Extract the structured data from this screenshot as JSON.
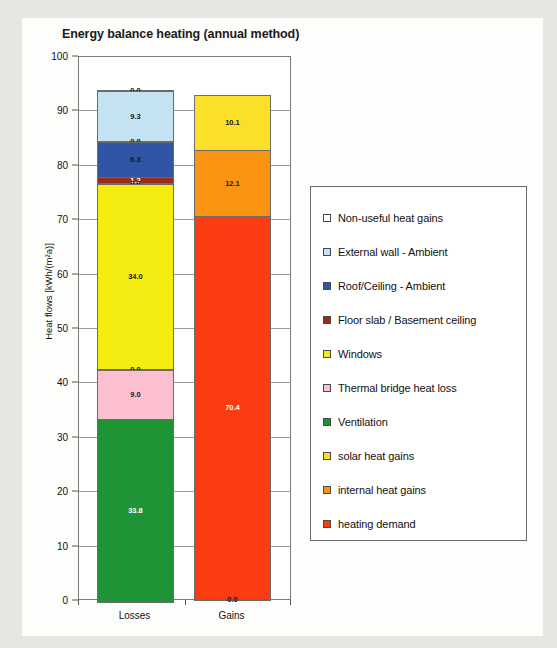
{
  "chart_data": {
    "type": "bar",
    "stacked": true,
    "title": "Energy balance heating (annual method)",
    "xlabel": "",
    "ylabel": "Heat flows [kWh/(m²a)]",
    "ylim": [
      0,
      100
    ],
    "ytick_labels": [
      "100",
      "90",
      "80",
      "70",
      "60",
      "50",
      "40",
      "30",
      "20",
      "10",
      "0"
    ],
    "ytick_values": [
      100,
      90,
      80,
      70,
      60,
      50,
      40,
      30,
      20,
      10,
      0
    ],
    "grid": true,
    "legend_position": "right",
    "categories": [
      "Losses",
      "Gains"
    ],
    "series": [
      {
        "name": "Non-useful heat gains",
        "color": "#ffffff",
        "values": [
          0.0,
          null
        ]
      },
      {
        "name": "External wall - Ambient",
        "color": "#c5e2f2",
        "values": [
          9.3,
          null
        ]
      },
      {
        "name": "Roof/Ceiling - Ambient",
        "color": "#2f55a4",
        "values": [
          6.3,
          null
        ]
      },
      {
        "name": "Floor slab / Basement ceiling",
        "color": "#9e2a15",
        "values": [
          1.2,
          null
        ]
      },
      {
        "name": "Windows",
        "color": "#f5ec12",
        "values": [
          34.0,
          null
        ]
      },
      {
        "name": "Thermal bridge heat loss",
        "color": "#fbbfcf",
        "values": [
          9.0,
          null
        ]
      },
      {
        "name": "Ventilation",
        "color": "#1f9437",
        "values": [
          33.8,
          null
        ]
      },
      {
        "name": "solar heat gains",
        "color": "#fbe02a",
        "values": [
          null,
          10.1
        ]
      },
      {
        "name": "internal heat gains",
        "color": "#fb9412",
        "values": [
          null,
          12.1
        ]
      },
      {
        "name": "heating demand",
        "color": "#fb3b12",
        "values": [
          null,
          70.4
        ]
      }
    ],
    "losses_stack": [
      {
        "label": "0.0",
        "value": 0.0,
        "series": "Non-useful heat gains",
        "color": "#ffffff",
        "text": "dark"
      },
      {
        "label": "9.3",
        "value": 9.3,
        "series": "External wall - Ambient",
        "color": "#c5e2f2",
        "text": "dark"
      },
      {
        "label": "0.0",
        "value": 0.0,
        "series": "Roof/Ceiling spacer",
        "color": "#c5e2f2",
        "text": "dark"
      },
      {
        "label": "6.3",
        "value": 6.3,
        "series": "Roof/Ceiling - Ambient",
        "color": "#2f55a4",
        "text": "dark"
      },
      {
        "label": "1.2",
        "value": 1.2,
        "series": "Floor slab / Basement ceiling",
        "color": "#9e2a15",
        "text": "light"
      },
      {
        "label": "0.0",
        "value": 0.0,
        "series": "Windows spacer",
        "color": "#f5ec12",
        "text": "dark"
      },
      {
        "label": "34.0",
        "value": 34.0,
        "series": "Windows",
        "color": "#f5ec12",
        "text": "dark"
      },
      {
        "label": "0.0",
        "value": 0.0,
        "series": "Thermal bridge spacer",
        "color": "#fbbfcf",
        "text": "dark"
      },
      {
        "label": "9.0",
        "value": 9.0,
        "series": "Thermal bridge heat loss",
        "color": "#fbbfcf",
        "text": "dark"
      },
      {
        "label": "33.8",
        "value": 33.8,
        "series": "Ventilation",
        "color": "#1f9437",
        "text": "light"
      }
    ],
    "gains_stack": [
      {
        "label": "10.1",
        "value": 10.1,
        "series": "solar heat gains",
        "color": "#fbe02a",
        "text": "dark"
      },
      {
        "label": "12.1",
        "value": 12.1,
        "series": "internal heat gains",
        "color": "#fb9412",
        "text": "dark"
      },
      {
        "label": "70.4",
        "value": 70.4,
        "series": "heating demand",
        "color": "#fb3b12",
        "text": "light"
      },
      {
        "label": "0.0",
        "value": 0.0,
        "series": "baseline",
        "color": "#fb3b12",
        "text": "dark"
      }
    ],
    "losses_total": 92.6,
    "gains_total": 92.6
  }
}
